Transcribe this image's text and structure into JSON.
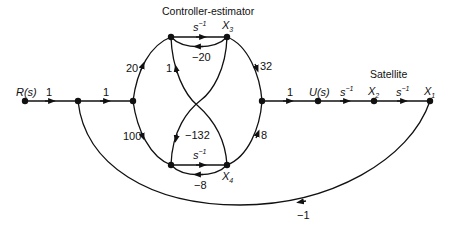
{
  "titles": {
    "controller": "Controller-estimator",
    "plant": "Satellite"
  },
  "nodes": {
    "input": "R(s)",
    "control": "U(s)",
    "x1": {
      "base": "X",
      "sub": "1"
    },
    "x2": {
      "base": "X",
      "sub": "2"
    },
    "x3": {
      "base": "X",
      "sub": "3"
    },
    "x4": {
      "base": "X",
      "sub": "4"
    }
  },
  "gains": {
    "r_to_n2": "1",
    "n2_to_n3": "1",
    "n3_to_top": "20",
    "n3_to_bottom": "100",
    "top_integrator": {
      "base": "s",
      "sup": "−1"
    },
    "x3_feedback": "−20",
    "bottom_to_top_cross": "1",
    "x3_to_bottom_cross": "−132",
    "bottom_integrator": {
      "base": "s",
      "sup": "−1"
    },
    "x4_feedback": "−8",
    "x3_to_junction": "32",
    "x4_to_junction": "8",
    "junction_to_u": "1",
    "u_to_x2": {
      "base": "s",
      "sup": "−1"
    },
    "x2_to_x1": {
      "base": "s",
      "sup": "−1"
    },
    "outer_feedback": "−1"
  }
}
